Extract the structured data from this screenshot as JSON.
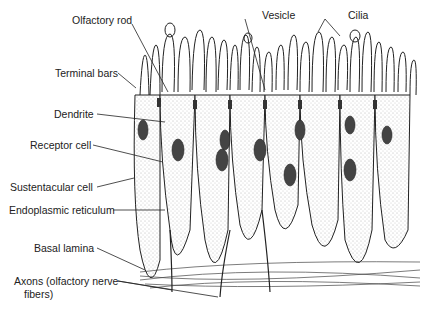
{
  "diagram": {
    "labels": {
      "olfactory_rod": "Olfactory rod",
      "vesicle": "Vesicle",
      "cilia": "Cilia",
      "terminal_bars": "Terminal bars",
      "dendrite": "Dendrite",
      "receptor_cell": "Receptor cell",
      "sustentacular_cell": "Sustentacular cell",
      "endoplasmic_reticulum": "Endoplasmic reticulum",
      "basal_lamina": "Basal lamina",
      "axons_line1": "Axons (olfactory nerve",
      "axons_line2": "fibers)"
    },
    "colors": {
      "ink": "#222222",
      "background": "#ffffff"
    }
  }
}
